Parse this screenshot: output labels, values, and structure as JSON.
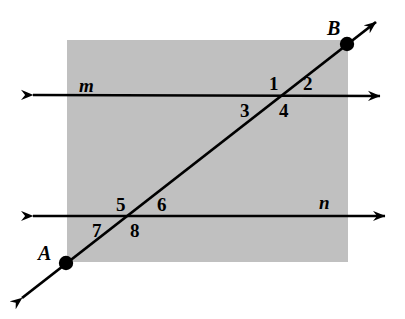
{
  "figure": {
    "background_color": "#ffffff",
    "shaded_region": {
      "name": "gray-plane-rectangle",
      "color": "#c0c0c0",
      "x": 67,
      "y": 40,
      "width": 281,
      "height": 222
    },
    "stroke_color": "#000000",
    "points": [
      {
        "id": "A",
        "label": "A",
        "dot_x": 66,
        "dot_y": 263,
        "label_x": 38,
        "label_y": 243
      },
      {
        "id": "B",
        "label": "B",
        "dot_x": 347,
        "dot_y": 44,
        "label_x": 327,
        "label_y": 18
      }
    ],
    "lines": [
      {
        "id": "m",
        "label": "m",
        "label_x": 79,
        "label_y": 76,
        "x1": 33,
        "y1": 95,
        "x2": 380,
        "y2": 96,
        "arrow_start": true,
        "arrow_end": true
      },
      {
        "id": "n",
        "label": "n",
        "label_x": 319,
        "label_y": 193,
        "x1": 33,
        "y1": 216,
        "x2": 385,
        "y2": 216,
        "arrow_start": true,
        "arrow_end": true
      },
      {
        "id": "transversal-AB",
        "label": "",
        "x1": 22,
        "y1": 298,
        "x2": 376,
        "y2": 22,
        "arrow_start": true,
        "arrow_end": true
      }
    ],
    "intersections": [
      {
        "id": "m-transversal",
        "x": 283,
        "y": 95
      },
      {
        "id": "n-transversal",
        "x": 133,
        "y": 216
      }
    ],
    "angle_labels": [
      {
        "id": "1",
        "text": "1",
        "x": 269,
        "y": 74
      },
      {
        "id": "2",
        "text": "2",
        "x": 303,
        "y": 74
      },
      {
        "id": "3",
        "text": "3",
        "x": 240,
        "y": 101
      },
      {
        "id": "4",
        "text": "4",
        "x": 279,
        "y": 101
      },
      {
        "id": "5",
        "text": "5",
        "x": 116,
        "y": 195
      },
      {
        "id": "6",
        "text": "6",
        "x": 157,
        "y": 195
      },
      {
        "id": "7",
        "text": "7",
        "x": 92,
        "y": 221
      },
      {
        "id": "8",
        "text": "8",
        "x": 130,
        "y": 221
      }
    ]
  },
  "chart_data": {
    "type": "diagram",
    "elements": {
      "parallel_lines": [
        "m",
        "n"
      ],
      "transversal_endpoints": [
        "A",
        "B"
      ],
      "angle_numbers": [
        "1",
        "2",
        "3",
        "4",
        "5",
        "6",
        "7",
        "8"
      ],
      "angles_at_line_m": [
        "1",
        "2",
        "3",
        "4"
      ],
      "angles_at_line_n": [
        "5",
        "6",
        "7",
        "8"
      ]
    }
  }
}
